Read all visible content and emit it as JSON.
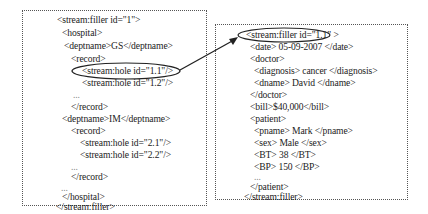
{
  "left_box": {
    "lines": [
      "<stream:filler id=\"1\">",
      "<hospital>",
      "<deptname>GS</deptname>",
      "<record>",
      "<stream:hole id=\"1.1\"/>",
      "<stream:hole id=\"1.2\"/>",
      "...",
      "</record>",
      "<deptname>IM</deptname>",
      "<record>",
      "<stream:hole id=\"2.1\"/>",
      "<stream:hole id=\"2.2\"/>",
      "...",
      "</record>",
      "...",
      "</hospital>",
      "</stream:filler>"
    ]
  },
  "right_box": {
    "lines": [
      "<stream:filler id=\"1.1\" >",
      "<date> 05-09-2007 </date>",
      "<doctor>",
      "<diagnosis> cancer </diagnosis>",
      "<dname> David </dname>",
      "</doctor>",
      "<bill>$40,000</bill>",
      "<patient>",
      "<pname> Mark </pname>",
      "<sex> Male </sex>",
      "<BT> 38 </BT>",
      "<BP> 150 </BP>",
      "...",
      "</patient>",
      "</stream:filler>"
    ]
  },
  "connector": {
    "from": "stream:hole id=1.1",
    "to": "stream:filler id=1.1"
  }
}
